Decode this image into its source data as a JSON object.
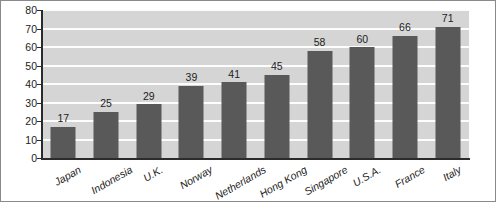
{
  "chart_data": {
    "type": "bar",
    "title": "",
    "subtitle": "",
    "xlabel": "",
    "ylabel": "",
    "ylim": [
      0,
      80
    ],
    "ytick_step": 10,
    "ytick_labels": [
      "80",
      "70",
      "60",
      "50",
      "40",
      "30",
      "20",
      "10",
      "0"
    ],
    "grid": true,
    "gridlines": "horizontal",
    "legend": "none",
    "orientation": "vertical",
    "data_labels": true,
    "xtick_rotation": -30,
    "categories": [
      "Japan",
      "Indonesia",
      "U.K.",
      "Norway",
      "Netherlands",
      "Hong Kong",
      "Singapore",
      "U.S.A.",
      "France",
      "Italy"
    ],
    "values": [
      17,
      25,
      29,
      39,
      41,
      45,
      58,
      60,
      66,
      71
    ],
    "value_labels": [
      "17",
      "25",
      "29",
      "39",
      "41",
      "45",
      "58",
      "60",
      "66",
      "71"
    ],
    "series": [
      {
        "name": "",
        "values": [
          17,
          25,
          29,
          39,
          41,
          45,
          58,
          60,
          66,
          71
        ]
      }
    ]
  },
  "style": {
    "bar_color": "#595959",
    "plot_background": "#d5d5d5",
    "gridline_color": "#fdfdfd",
    "axis_color": "#2b2b2b",
    "text_color": "#1c1c1c",
    "page_background": "#ffffff",
    "frame_border": "#8a8a8a"
  }
}
